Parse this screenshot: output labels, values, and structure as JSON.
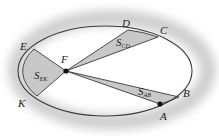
{
  "figure": {
    "ellipse": {
      "cx": 105,
      "cy": 71,
      "rx": 87,
      "ry": 45
    },
    "focus": {
      "label": "F",
      "x": 66,
      "y": 71,
      "label_x": 61,
      "label_y": 63
    },
    "points": [
      {
        "id": "A",
        "label": "A",
        "x": 160,
        "y": 104,
        "label_x": 160,
        "label_y": 120
      },
      {
        "id": "B",
        "label": "B",
        "x": 179,
        "y": 97,
        "label_x": 183,
        "label_y": 97
      },
      {
        "id": "C",
        "label": "C",
        "x": 158,
        "y": 37,
        "label_x": 160,
        "label_y": 34
      },
      {
        "id": "D",
        "label": "D",
        "x": 128,
        "y": 30,
        "label_x": 122,
        "label_y": 27
      },
      {
        "id": "E",
        "label": "E",
        "x": 34,
        "y": 49,
        "label_x": 20,
        "label_y": 50
      },
      {
        "id": "K",
        "label": "K",
        "x": 37,
        "y": 96,
        "label_x": 18,
        "label_y": 107
      }
    ],
    "sectors": [
      {
        "id": "S_AB",
        "main": "S",
        "sub": "AB",
        "from": "A",
        "to": "B",
        "label_x": 138,
        "label_y": 95
      },
      {
        "id": "S_CD",
        "main": "S",
        "sub": "CD",
        "from": "C",
        "to": "D",
        "label_x": 116,
        "label_y": 46
      },
      {
        "id": "S_EK",
        "main": "S",
        "sub": "EK",
        "from": "E",
        "to": "K",
        "label_x": 34,
        "label_y": 79
      }
    ],
    "colors": {
      "sector_fill": "#c8c8c8",
      "line": "#3a3a3a",
      "halo": "#d9d9d9",
      "point": "#111111"
    }
  }
}
